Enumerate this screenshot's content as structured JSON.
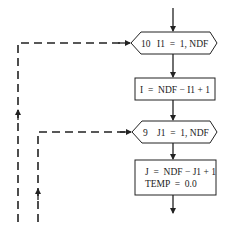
{
  "diagram": {
    "type": "flowchart",
    "nodes": [
      {
        "id": "loop-outer",
        "shape": "hexagon",
        "label_num": "10",
        "label_expr": "I1  =  1, NDF"
      },
      {
        "id": "assign-i",
        "shape": "rectangle",
        "label": "I  =  NDF − I1 + 1"
      },
      {
        "id": "loop-inner",
        "shape": "hexagon",
        "label_num": "9",
        "label_expr": "J1  =  1, NDF"
      },
      {
        "id": "assign-j",
        "shape": "rectangle",
        "label_line1": "J  =  NDF − J1 + 1",
        "label_line2": "TEMP  =  0.0"
      }
    ],
    "edges": [
      {
        "from": "entry",
        "to": "loop-outer",
        "style": "solid"
      },
      {
        "from": "loop-outer",
        "to": "assign-i",
        "style": "solid"
      },
      {
        "from": "assign-i",
        "to": "loop-inner",
        "style": "solid"
      },
      {
        "from": "loop-inner",
        "to": "assign-j",
        "style": "solid"
      },
      {
        "from": "assign-j",
        "to": "continues",
        "style": "solid"
      },
      {
        "from": "outer-loop-return",
        "to": "loop-outer",
        "style": "dashed"
      },
      {
        "from": "inner-loop-return",
        "to": "loop-inner",
        "style": "dashed"
      }
    ],
    "colors": {
      "stroke": "#222222",
      "background": "#ffffff"
    }
  }
}
